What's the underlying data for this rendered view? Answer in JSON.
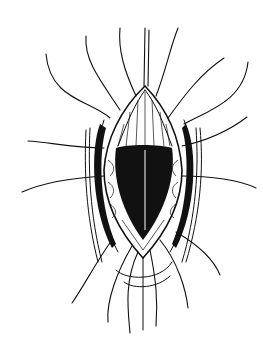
{
  "figure": {
    "background_color": "#ffffff",
    "ink_color": "#111111",
    "width": 274,
    "height": 356
  }
}
